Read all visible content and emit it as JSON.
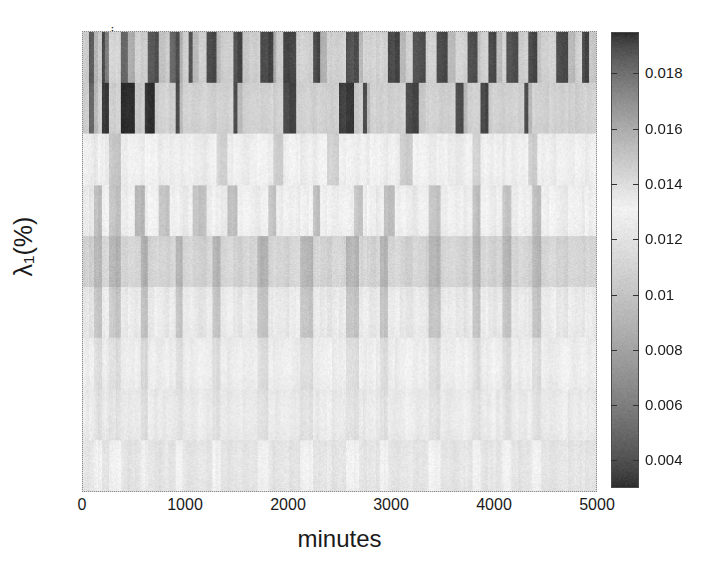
{
  "chart_data": {
    "type": "heatmap",
    "title": "",
    "xlabel": "minutes",
    "ylabel": "λ₁(%)",
    "xlim": [
      0,
      5000
    ],
    "xticks": [
      0,
      1000,
      2000,
      3000,
      4000,
      5000
    ],
    "xticklabels": [
      "0",
      "1000",
      "2000",
      "3000",
      "4000",
      "5000"
    ],
    "yticklabels": [
      "a",
      "b",
      "c",
      "d",
      "e",
      "f",
      "g",
      "h",
      "i"
    ],
    "ytick_order_top_to_bottom": [
      "i",
      "h",
      "g",
      "f",
      "e",
      "d",
      "c",
      "b",
      "a"
    ],
    "grid": false,
    "legend": "colorbar-right",
    "colorbar": {
      "ticks": [
        0.018,
        0.016,
        0.014,
        0.012,
        0.01,
        0.008,
        0.006,
        0.004
      ],
      "ticklabels": [
        "0.018",
        "0.016",
        "0.014",
        "0.012",
        "0.01",
        "0.008",
        "0.006",
        "0.004"
      ],
      "vmin": 0.003,
      "vmax": 0.0195,
      "colormap": "grayscale-nonmonotonic-bright-mid",
      "dark_color": "#2e2e2e",
      "bright_color": "#f2f2f2",
      "bright_value": 0.0131
    },
    "rows": [
      {
        "label": "i",
        "mean": 0.0168,
        "contrast": 0.0048
      },
      {
        "label": "h",
        "mean": 0.0166,
        "contrast": 0.0054
      },
      {
        "label": "g",
        "mean": 0.0134,
        "contrast": 0.0022
      },
      {
        "label": "f",
        "mean": 0.0138,
        "contrast": 0.003
      },
      {
        "label": "e",
        "mean": 0.0143,
        "contrast": 0.0028
      },
      {
        "label": "d",
        "mean": 0.0136,
        "contrast": 0.0026
      },
      {
        "label": "c",
        "mean": 0.0128,
        "contrast": 0.0022
      },
      {
        "label": "b",
        "mean": 0.0126,
        "contrast": 0.0024
      },
      {
        "label": "a",
        "mean": 0.0122,
        "contrast": 0.0018
      }
    ],
    "n_columns": 96,
    "column_values": [
      [
        0.0148,
        0.0186,
        0.0157,
        0.0148,
        0.019,
        0.0176,
        0.0144,
        0.0144,
        0.0183,
        0.016,
        0.0145,
        0.0148,
        0.0147,
        0.0187,
        0.019,
        0.0152,
        0.0147,
        0.0183,
        0.019,
        0.0159,
        0.0146,
        0.0188,
        0.0155,
        0.0146,
        0.019,
        0.0191,
        0.0155,
        0.0147,
        0.0146,
        0.0188,
        0.0192,
        0.015,
        0.0147,
        0.0145,
        0.019,
        0.0192,
        0.016,
        0.0147,
        0.0192,
        0.0191,
        0.0146,
        0.0145,
        0.0147,
        0.019,
        0.0192,
        0.0158,
        0.0146,
        0.0146,
        0.0145,
        0.0188,
        0.019,
        0.0156,
        0.0145,
        0.0145,
        0.0144,
        0.0146,
        0.0144,
        0.0145,
        0.019,
        0.0192,
        0.0156,
        0.0145,
        0.0188,
        0.019,
        0.0147,
        0.0145,
        0.019,
        0.0191,
        0.0155,
        0.0144,
        0.0146,
        0.0189,
        0.019,
        0.0152,
        0.0146,
        0.0145,
        0.019,
        0.0191,
        0.0154,
        0.0145,
        0.0188,
        0.019,
        0.0148,
        0.0146,
        0.019,
        0.0192,
        0.0152,
        0.0146,
        0.0145,
        0.019,
        0.0191,
        0.0155,
        0.0145,
        0.019,
        0.0192,
        0.015
      ],
      [
        0.0147,
        0.0183,
        0.0155,
        0.0145,
        0.0193,
        0.0194,
        0.0147,
        0.0145,
        0.0196,
        0.0196,
        0.015,
        0.0146,
        0.0194,
        0.0195,
        0.0148,
        0.0145,
        0.0144,
        0.0146,
        0.019,
        0.0155,
        0.0145,
        0.0145,
        0.0146,
        0.0144,
        0.0146,
        0.0148,
        0.0145,
        0.0146,
        0.0144,
        0.019,
        0.0155,
        0.0146,
        0.0145,
        0.0144,
        0.0146,
        0.0144,
        0.0148,
        0.0145,
        0.019,
        0.0192,
        0.0146,
        0.0145,
        0.0146,
        0.0147,
        0.0145,
        0.0146,
        0.0147,
        0.0146,
        0.0192,
        0.0194,
        0.015,
        0.0146,
        0.019,
        0.0155,
        0.0145,
        0.0146,
        0.0146,
        0.0145,
        0.0147,
        0.0146,
        0.0144,
        0.019,
        0.0192,
        0.015,
        0.0146,
        0.0145,
        0.0146,
        0.0147,
        0.0146,
        0.019,
        0.0155,
        0.0146,
        0.0145,
        0.0146,
        0.019,
        0.0192,
        0.0148,
        0.0145,
        0.0146,
        0.0147,
        0.0146,
        0.0145,
        0.0146,
        0.019,
        0.0155,
        0.0145,
        0.0146,
        0.0147,
        0.0145,
        0.0146,
        0.0145,
        0.0146,
        0.0147,
        0.0145,
        0.0146,
        0.0145
      ],
      [
        0.0133,
        0.0134,
        0.0136,
        0.0132,
        0.0133,
        0.0135,
        0.015,
        0.0152,
        0.0134,
        0.0132,
        0.0133,
        0.0135,
        0.0131,
        0.013,
        0.0132,
        0.0134,
        0.0128,
        0.0127,
        0.0133,
        0.0135,
        0.0133,
        0.0132,
        0.0134,
        0.0136,
        0.0133,
        0.0131,
        0.0144,
        0.0146,
        0.0134,
        0.0132,
        0.0133,
        0.0135,
        0.0133,
        0.0131,
        0.0132,
        0.0134,
        0.0146,
        0.0148,
        0.0133,
        0.0131,
        0.0132,
        0.0134,
        0.0133,
        0.0135,
        0.0132,
        0.0131,
        0.0144,
        0.0146,
        0.0133,
        0.0132,
        0.0134,
        0.0132,
        0.0133,
        0.0135,
        0.0132,
        0.0131,
        0.0133,
        0.0135,
        0.0132,
        0.0134,
        0.0146,
        0.0148,
        0.0132,
        0.0131,
        0.0133,
        0.0135,
        0.0133,
        0.0132,
        0.0134,
        0.0136,
        0.0132,
        0.013,
        0.0144,
        0.0146,
        0.0133,
        0.0132,
        0.0134,
        0.0132,
        0.0133,
        0.0135,
        0.0132,
        0.0134,
        0.0133,
        0.0131,
        0.0146,
        0.0148,
        0.0132,
        0.0133,
        0.0135,
        0.0132,
        0.0133,
        0.0134,
        0.0132,
        0.0133,
        0.0135,
        0.0132
      ],
      [
        0.0134,
        0.0136,
        0.0152,
        0.0155,
        0.0133,
        0.0131,
        0.015,
        0.0153,
        0.0134,
        0.0132,
        0.0155,
        0.0157,
        0.0134,
        0.0131,
        0.0133,
        0.015,
        0.0152,
        0.0133,
        0.0131,
        0.0134,
        0.0136,
        0.0132,
        0.015,
        0.0152,
        0.0134,
        0.0132,
        0.0133,
        0.0135,
        0.0152,
        0.0154,
        0.0133,
        0.0131,
        0.0134,
        0.0136,
        0.0132,
        0.015,
        0.0152,
        0.0134,
        0.0132,
        0.0133,
        0.0135,
        0.0133,
        0.0131,
        0.0152,
        0.0154,
        0.0133,
        0.0132,
        0.0134,
        0.0132,
        0.0133,
        0.015,
        0.0152,
        0.0134,
        0.0131,
        0.0133,
        0.0135,
        0.0132,
        0.0152,
        0.0154,
        0.0133,
        0.0131,
        0.0134,
        0.0136,
        0.0132,
        0.0133,
        0.015,
        0.0152,
        0.0134,
        0.0132,
        0.0133,
        0.0135,
        0.0133,
        0.0152,
        0.0154,
        0.0132,
        0.0131,
        0.0134,
        0.0136,
        0.0133,
        0.015,
        0.0152,
        0.0134,
        0.0132,
        0.0133,
        0.0135,
        0.0152,
        0.0154,
        0.0133,
        0.0131,
        0.0134,
        0.0136,
        0.0132,
        0.0133,
        0.0135,
        0.0132,
        0.0133
      ],
      [
        0.0145,
        0.0147,
        0.0155,
        0.0157,
        0.0144,
        0.0142,
        0.0156,
        0.0158,
        0.0145,
        0.0143,
        0.0144,
        0.0158,
        0.016,
        0.0145,
        0.0143,
        0.0144,
        0.0146,
        0.0143,
        0.0156,
        0.0158,
        0.0144,
        0.0142,
        0.0145,
        0.0147,
        0.0143,
        0.0156,
        0.0158,
        0.0144,
        0.0142,
        0.0145,
        0.0147,
        0.0143,
        0.0144,
        0.0156,
        0.0158,
        0.0145,
        0.0143,
        0.0144,
        0.0146,
        0.0143,
        0.0142,
        0.0156,
        0.0158,
        0.0144,
        0.0143,
        0.0145,
        0.0147,
        0.0143,
        0.0144,
        0.0156,
        0.0158,
        0.0145,
        0.0142,
        0.0144,
        0.0146,
        0.0143,
        0.0156,
        0.0158,
        0.0144,
        0.0142,
        0.0145,
        0.0147,
        0.0143,
        0.0144,
        0.0146,
        0.0156,
        0.0158,
        0.0144,
        0.0143,
        0.0145,
        0.0147,
        0.0143,
        0.0156,
        0.0158,
        0.0144,
        0.0142,
        0.0145,
        0.0147,
        0.0144,
        0.0156,
        0.0158,
        0.0145,
        0.0143,
        0.0144,
        0.0146,
        0.0156,
        0.0158,
        0.0144,
        0.0142,
        0.0145,
        0.0147,
        0.0143,
        0.0144,
        0.0146,
        0.0143,
        0.0144
      ],
      [
        0.0136,
        0.0138,
        0.015,
        0.0152,
        0.0135,
        0.0133,
        0.0148,
        0.0151,
        0.0136,
        0.0134,
        0.0135,
        0.0152,
        0.0154,
        0.0136,
        0.0133,
        0.0135,
        0.0137,
        0.0134,
        0.015,
        0.0152,
        0.0135,
        0.0133,
        0.0136,
        0.0138,
        0.0134,
        0.015,
        0.0152,
        0.0135,
        0.0133,
        0.0136,
        0.0138,
        0.0134,
        0.0135,
        0.015,
        0.0152,
        0.0136,
        0.0134,
        0.0135,
        0.0137,
        0.0134,
        0.0133,
        0.015,
        0.0152,
        0.0135,
        0.0134,
        0.0136,
        0.0138,
        0.0134,
        0.0135,
        0.015,
        0.0152,
        0.0136,
        0.0133,
        0.0135,
        0.0137,
        0.0134,
        0.015,
        0.0152,
        0.0135,
        0.0133,
        0.0136,
        0.0138,
        0.0134,
        0.0135,
        0.0137,
        0.015,
        0.0152,
        0.0135,
        0.0134,
        0.0136,
        0.0138,
        0.0134,
        0.015,
        0.0152,
        0.0135,
        0.0133,
        0.0136,
        0.0138,
        0.0135,
        0.015,
        0.0152,
        0.0136,
        0.0134,
        0.0135,
        0.0137,
        0.015,
        0.0152,
        0.0135,
        0.0133,
        0.0136,
        0.0138,
        0.0134,
        0.0135,
        0.0137,
        0.0134,
        0.0135
      ],
      [
        0.0127,
        0.0129,
        0.014,
        0.0142,
        0.0126,
        0.0125,
        0.0139,
        0.0141,
        0.0127,
        0.0126,
        0.0127,
        0.0142,
        0.0144,
        0.0128,
        0.0125,
        0.0126,
        0.0128,
        0.0126,
        0.014,
        0.0142,
        0.0127,
        0.0125,
        0.0127,
        0.0129,
        0.0126,
        0.014,
        0.0142,
        0.0127,
        0.0125,
        0.0127,
        0.0129,
        0.0126,
        0.0127,
        0.014,
        0.0142,
        0.0128,
        0.0126,
        0.0127,
        0.0129,
        0.0126,
        0.0125,
        0.014,
        0.0142,
        0.0127,
        0.0126,
        0.0128,
        0.013,
        0.0126,
        0.0127,
        0.014,
        0.0142,
        0.0128,
        0.0125,
        0.0127,
        0.0129,
        0.0126,
        0.014,
        0.0142,
        0.0127,
        0.0125,
        0.0128,
        0.013,
        0.0126,
        0.0127,
        0.0129,
        0.014,
        0.0142,
        0.0127,
        0.0126,
        0.0128,
        0.013,
        0.0126,
        0.014,
        0.0142,
        0.0127,
        0.0125,
        0.0128,
        0.013,
        0.0127,
        0.014,
        0.0142,
        0.0128,
        0.0126,
        0.0127,
        0.0129,
        0.014,
        0.0142,
        0.0127,
        0.0125,
        0.0128,
        0.013,
        0.0126,
        0.0127,
        0.0129,
        0.0126,
        0.0127
      ],
      [
        0.0125,
        0.0127,
        0.0138,
        0.014,
        0.0124,
        0.0123,
        0.0137,
        0.0139,
        0.0125,
        0.0124,
        0.0125,
        0.014,
        0.0142,
        0.0126,
        0.0123,
        0.0124,
        0.0126,
        0.0124,
        0.0138,
        0.014,
        0.0125,
        0.0123,
        0.0125,
        0.0127,
        0.0124,
        0.0138,
        0.014,
        0.0125,
        0.0123,
        0.0125,
        0.0127,
        0.0124,
        0.0125,
        0.0138,
        0.014,
        0.0126,
        0.0124,
        0.0125,
        0.0127,
        0.0124,
        0.0123,
        0.0138,
        0.014,
        0.0125,
        0.0124,
        0.0126,
        0.0128,
        0.0124,
        0.0125,
        0.0138,
        0.014,
        0.0126,
        0.0123,
        0.0125,
        0.0127,
        0.0124,
        0.0138,
        0.014,
        0.0125,
        0.0123,
        0.0126,
        0.0128,
        0.0124,
        0.0125,
        0.0127,
        0.0138,
        0.014,
        0.0125,
        0.0124,
        0.0126,
        0.0128,
        0.0124,
        0.0138,
        0.014,
        0.0125,
        0.0123,
        0.0126,
        0.0128,
        0.0125,
        0.0138,
        0.014,
        0.0126,
        0.0124,
        0.0125,
        0.0127,
        0.0138,
        0.014,
        0.0125,
        0.0123,
        0.0126,
        0.0128,
        0.0124,
        0.0125,
        0.0127,
        0.0124,
        0.0125
      ],
      [
        0.0121,
        0.0123,
        0.013,
        0.0132,
        0.012,
        0.0119,
        0.0129,
        0.0131,
        0.0121,
        0.012,
        0.0121,
        0.0132,
        0.0134,
        0.0122,
        0.0119,
        0.012,
        0.0122,
        0.012,
        0.013,
        0.0132,
        0.0121,
        0.0119,
        0.0121,
        0.0123,
        0.012,
        0.013,
        0.0132,
        0.0121,
        0.0119,
        0.0121,
        0.0123,
        0.012,
        0.0121,
        0.013,
        0.0132,
        0.0122,
        0.012,
        0.0121,
        0.0123,
        0.012,
        0.0119,
        0.013,
        0.0132,
        0.0121,
        0.012,
        0.0122,
        0.0124,
        0.012,
        0.0121,
        0.013,
        0.0132,
        0.0122,
        0.0119,
        0.0121,
        0.0123,
        0.012,
        0.013,
        0.0132,
        0.0121,
        0.0119,
        0.0122,
        0.0124,
        0.012,
        0.0121,
        0.0123,
        0.013,
        0.0132,
        0.0121,
        0.012,
        0.0122,
        0.0124,
        0.012,
        0.013,
        0.0132,
        0.0121,
        0.0119,
        0.0122,
        0.0124,
        0.0121,
        0.013,
        0.0132,
        0.0122,
        0.012,
        0.0121,
        0.0123,
        0.013,
        0.0132,
        0.0121,
        0.0119,
        0.0122,
        0.0124,
        0.012,
        0.0121,
        0.0123,
        0.012,
        0.0121
      ]
    ]
  }
}
